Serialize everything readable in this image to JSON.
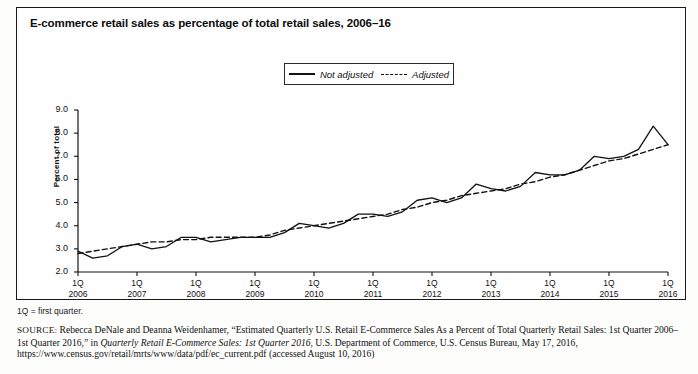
{
  "figure": {
    "title": "E-commerce retail sales as percentage of total retail sales, 2006–16",
    "footnote": "1Q = first quarter.",
    "source_label": "SOURCE:",
    "source_part1": " Rebecca DeNale and Deanna Weidenhamer, “Estimated Quarterly U.S. Retail E-Commerce Sales As a Percent of Total Quarterly Retail Sales: 1st Quarter 2006–1st Quarter 2016,” in ",
    "source_italic": "Quarterly Retail E-Commerce Sales: 1st Quarter 2016",
    "source_part2": ", U.S. Department of Commerce, U.S. Census Bureau, May 17, 2016, https://www.census.gov/retail/mrts/www/data/pdf/ec_current.pdf (accessed August 10, 2016)"
  },
  "legend": {
    "position": "top-center",
    "items": [
      {
        "label": "Not adjusted",
        "style": "solid",
        "color": "#111111"
      },
      {
        "label": "Adjusted",
        "style": "dashed",
        "color": "#111111"
      }
    ]
  },
  "chart_data": {
    "type": "line",
    "title": "E-commerce retail sales as percentage of total retail sales, 2006–16",
    "xlabel": "",
    "ylabel": "Percent of total",
    "ylim": [
      2.0,
      9.0
    ],
    "ytick_labels": [
      "2.0",
      "3.0",
      "4.0",
      "5.0",
      "6.0",
      "7.0",
      "8.0",
      "9.0"
    ],
    "ytick_values": [
      2.0,
      3.0,
      4.0,
      5.0,
      6.0,
      7.0,
      8.0,
      9.0
    ],
    "grid": false,
    "xtick_quarter_label": "1Q",
    "xtick_years": [
      "2006",
      "2007",
      "2008",
      "2009",
      "2010",
      "2011",
      "2012",
      "2013",
      "2014",
      "2015",
      "2016"
    ],
    "x_quarters": [
      "1Q 2006",
      "2Q 2006",
      "3Q 2006",
      "4Q 2006",
      "1Q 2007",
      "2Q 2007",
      "3Q 2007",
      "4Q 2007",
      "1Q 2008",
      "2Q 2008",
      "3Q 2008",
      "4Q 2008",
      "1Q 2009",
      "2Q 2009",
      "3Q 2009",
      "4Q 2009",
      "1Q 2010",
      "2Q 2010",
      "3Q 2010",
      "4Q 2010",
      "1Q 2011",
      "2Q 2011",
      "3Q 2011",
      "4Q 2011",
      "1Q 2012",
      "2Q 2012",
      "3Q 2012",
      "4Q 2012",
      "1Q 2013",
      "2Q 2013",
      "3Q 2013",
      "4Q 2013",
      "1Q 2014",
      "2Q 2014",
      "3Q 2014",
      "4Q 2014",
      "1Q 2015",
      "2Q 2015",
      "3Q 2015",
      "4Q 2015",
      "1Q 2016"
    ],
    "series": [
      {
        "name": "Not adjusted",
        "style": "solid",
        "color": "#111111",
        "values": [
          2.9,
          2.6,
          2.7,
          3.1,
          3.2,
          3.0,
          3.1,
          3.5,
          3.5,
          3.3,
          3.4,
          3.5,
          3.5,
          3.5,
          3.7,
          4.1,
          4.0,
          3.9,
          4.1,
          4.5,
          4.5,
          4.4,
          4.6,
          5.1,
          5.2,
          5.0,
          5.2,
          5.8,
          5.6,
          5.5,
          5.7,
          6.3,
          6.2,
          6.2,
          6.4,
          7.0,
          6.9,
          7.0,
          7.3,
          8.3,
          7.5
        ]
      },
      {
        "name": "Adjusted",
        "style": "dashed",
        "color": "#111111",
        "values": [
          2.8,
          2.9,
          3.0,
          3.1,
          3.2,
          3.3,
          3.3,
          3.4,
          3.4,
          3.5,
          3.5,
          3.5,
          3.5,
          3.6,
          3.8,
          3.9,
          4.0,
          4.1,
          4.2,
          4.3,
          4.4,
          4.5,
          4.7,
          4.8,
          5.0,
          5.1,
          5.3,
          5.4,
          5.5,
          5.6,
          5.8,
          5.9,
          6.1,
          6.2,
          6.4,
          6.6,
          6.8,
          6.9,
          7.1,
          7.3,
          7.5
        ]
      }
    ]
  }
}
